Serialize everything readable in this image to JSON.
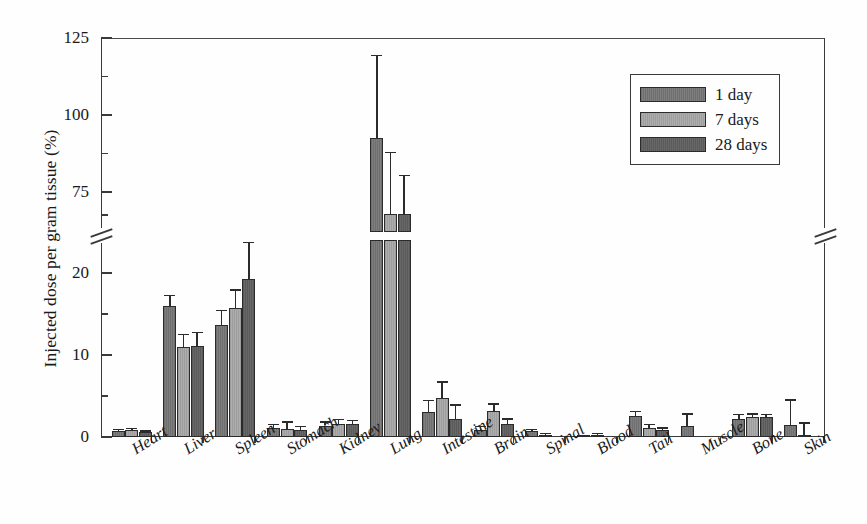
{
  "chart_data": {
    "type": "bar",
    "title": "",
    "xlabel": "",
    "ylabel": "Injected dose per gram tissue (%)",
    "grid": false,
    "legend_position": "top-right",
    "broken_axis": true,
    "axis_segments": [
      {
        "range": [
          0,
          24
        ],
        "ticks_major": [
          0,
          10,
          20
        ],
        "ticks_minor": [
          5,
          15
        ]
      },
      {
        "range": [
          62,
          125
        ],
        "ticks_major": [
          75,
          100,
          125
        ],
        "ticks_minor": [
          67.5,
          87.5,
          112.5
        ]
      }
    ],
    "ytick_labels": [
      "0",
      "10",
      "20",
      "75",
      "100",
      "125"
    ],
    "categories": [
      "Heart",
      "Liver",
      "Spleen",
      "Stomach",
      "Kidney",
      "Lung",
      "Intestine",
      "Brain",
      "Spinal",
      "Blood",
      "Tail",
      "Muscle",
      "Bone",
      "Skin"
    ],
    "series": [
      {
        "name": "1 day",
        "color": "#767676",
        "values": [
          0.7,
          16.0,
          13.7,
          1.1,
          1.4,
          92.5,
          3.0,
          0.9,
          0.7,
          0.1,
          2.6,
          1.4,
          2.2,
          1.5
        ],
        "errors": [
          0.3,
          1.3,
          1.8,
          0.5,
          0.5,
          27.0,
          1.5,
          0.5,
          0.3,
          0.1,
          0.6,
          1.5,
          0.6,
          3.1
        ]
      },
      {
        "name": "7 days",
        "color": "#a5a5a5",
        "values": [
          0.8,
          11.0,
          15.7,
          1.0,
          1.6,
          68.0,
          4.8,
          3.2,
          0.3,
          0.3,
          1.1,
          0.0,
          2.4,
          0.3
        ],
        "errors": [
          0.3,
          1.6,
          2.3,
          0.9,
          0.6,
          20.0,
          2.0,
          0.9,
          0.2,
          0.2,
          0.5,
          0.0,
          0.5,
          1.5
        ]
      },
      {
        "name": "28 days",
        "color": "#616161",
        "values": [
          0.6,
          11.1,
          19.3,
          0.9,
          1.6,
          68.0,
          2.2,
          1.6,
          0.0,
          0.0,
          0.8,
          0.0,
          2.4,
          0.0
        ],
        "errors": [
          0.2,
          1.7,
          4.5,
          0.5,
          0.5,
          12.5,
          1.8,
          0.7,
          0.0,
          0.0,
          0.4,
          0.0,
          0.4,
          0.0
        ]
      }
    ]
  },
  "legend": {
    "items": [
      {
        "label": "1 day",
        "swatch_class": "s0"
      },
      {
        "label": "7 days",
        "swatch_class": "s1"
      },
      {
        "label": "28 days",
        "swatch_class": "s2"
      }
    ]
  }
}
